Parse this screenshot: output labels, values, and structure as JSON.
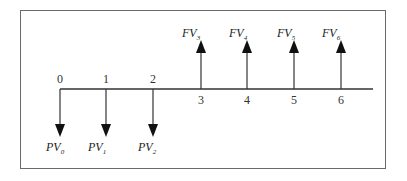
{
  "diagram": {
    "type": "cash-flow-timeline",
    "colors": {
      "frame": "#6a6a6a",
      "line": "#333333",
      "arrow": "#111111",
      "text": "#222222"
    },
    "periods": [
      {
        "label": "0",
        "x": 60,
        "label_pos": "above"
      },
      {
        "label": "1",
        "x": 106,
        "label_pos": "above"
      },
      {
        "label": "2",
        "x": 153,
        "label_pos": "above"
      },
      {
        "label": "3",
        "x": 201,
        "label_pos": "below"
      },
      {
        "label": "4",
        "x": 247,
        "label_pos": "below"
      },
      {
        "label": "5",
        "x": 294,
        "label_pos": "below"
      },
      {
        "label": "6",
        "x": 341,
        "label_pos": "below"
      }
    ],
    "outflows": [
      {
        "label": "PV",
        "sub": "0",
        "x": 60
      },
      {
        "label": "PV",
        "sub": "1",
        "x": 106
      },
      {
        "label": "PV",
        "sub": "2",
        "x": 153
      }
    ],
    "inflows": [
      {
        "label": "FV",
        "sub": "3",
        "x": 201
      },
      {
        "label": "FV",
        "sub": "4",
        "x": 247
      },
      {
        "label": "FV",
        "sub": "5",
        "x": 294
      },
      {
        "label": "FV",
        "sub": "6",
        "x": 341
      }
    ]
  }
}
